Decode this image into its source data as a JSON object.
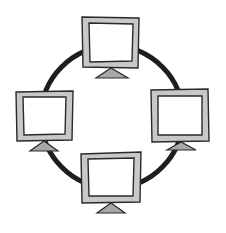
{
  "diagram": {
    "type": "ring-network-topology",
    "ring": {
      "cx": 112,
      "cy": 117,
      "r": 71,
      "stroke": "#1e1e1e",
      "stroke_width": 5
    },
    "colors": {
      "background": "#ffffff",
      "bezel": "#c8c8c8",
      "screen": "#ffffff",
      "outline": "#2a2a2a",
      "stand": "#a8a8a8"
    },
    "nodes": [
      {
        "id": "monitor-top",
        "x": 82,
        "y": 17,
        "w": 57,
        "h": 51
      },
      {
        "id": "monitor-left",
        "x": 16,
        "y": 91,
        "w": 57,
        "h": 50
      },
      {
        "id": "monitor-right",
        "x": 151,
        "y": 89,
        "w": 58,
        "h": 53
      },
      {
        "id": "monitor-bottom",
        "x": 81,
        "y": 152,
        "w": 60,
        "h": 51
      }
    ]
  }
}
